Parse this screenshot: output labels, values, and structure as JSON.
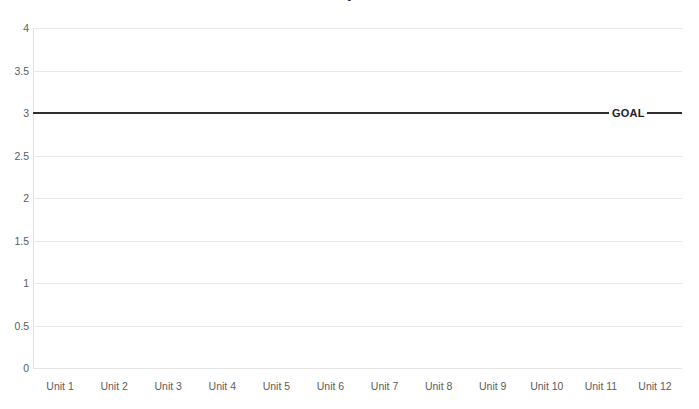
{
  "chart_data": {
    "type": "line",
    "title": "",
    "title_fragment_visible": "•",
    "xlabel": "",
    "ylabel": "",
    "categories": [
      "Unit 1",
      "Unit 2",
      "Unit 3",
      "Unit 4",
      "Unit 5",
      "Unit 6",
      "Unit 7",
      "Unit 8",
      "Unit 9",
      "Unit 10",
      "Unit 11",
      "Unit 12"
    ],
    "ylim": [
      0,
      4
    ],
    "ytick_labels": [
      "0",
      "0.5",
      "1",
      "1.5",
      "2",
      "2.5",
      "3",
      "3.5",
      "4"
    ],
    "ytick_values": [
      0,
      0.5,
      1,
      1.5,
      2,
      2.5,
      3,
      3.5,
      4
    ],
    "grid": "horizontal",
    "legend": "inline-annotation",
    "series": [
      {
        "name": "GOAL",
        "label": "GOAL",
        "color": "#2e2e2e",
        "values": [
          3,
          3,
          3,
          3,
          3,
          3,
          3,
          3,
          3,
          3,
          3,
          3
        ]
      }
    ],
    "annotations": [
      {
        "text": "GOAL",
        "value": 3,
        "category": "Unit 11"
      }
    ]
  },
  "colors": {
    "background": "#ffffff",
    "gridline": "#e9e9e9",
    "axis": "#e2e2e2",
    "tick_text": "#5c5c5c",
    "series_line": "#2e2e2e",
    "annotation_text": "#1f1f1f"
  }
}
